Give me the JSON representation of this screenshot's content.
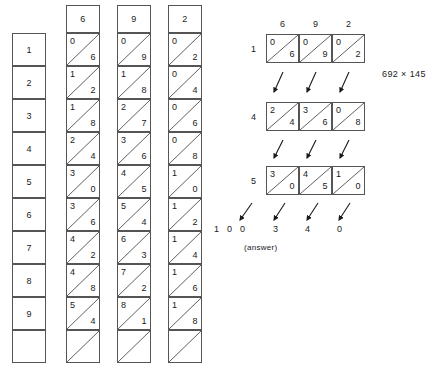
{
  "figure": {
    "expression": "692 × 145",
    "answer_caption": "(answer)",
    "answer_digits": "1  0  0      3      4      0"
  },
  "index_rod": {
    "label": "index",
    "values": [
      "1",
      "2",
      "3",
      "4",
      "5",
      "6",
      "7",
      "8",
      "9",
      ""
    ]
  },
  "rods": [
    {
      "name": "rod-6",
      "head": "6",
      "cells": [
        {
          "hi": "0",
          "lo": "6"
        },
        {
          "hi": "1",
          "lo": "2"
        },
        {
          "hi": "1",
          "lo": "8"
        },
        {
          "hi": "2",
          "lo": "4"
        },
        {
          "hi": "3",
          "lo": "0"
        },
        {
          "hi": "3",
          "lo": "6"
        },
        {
          "hi": "4",
          "lo": "2"
        },
        {
          "hi": "4",
          "lo": "8"
        },
        {
          "hi": "5",
          "lo": "4"
        },
        {
          "hi": "",
          "lo": ""
        }
      ]
    },
    {
      "name": "rod-9",
      "head": "9",
      "cells": [
        {
          "hi": "0",
          "lo": "9"
        },
        {
          "hi": "1",
          "lo": "8"
        },
        {
          "hi": "2",
          "lo": "7"
        },
        {
          "hi": "3",
          "lo": "6"
        },
        {
          "hi": "4",
          "lo": "5"
        },
        {
          "hi": "5",
          "lo": "4"
        },
        {
          "hi": "6",
          "lo": "3"
        },
        {
          "hi": "7",
          "lo": "2"
        },
        {
          "hi": "8",
          "lo": "1"
        },
        {
          "hi": "",
          "lo": ""
        }
      ]
    },
    {
      "name": "rod-2",
      "head": "2",
      "cells": [
        {
          "hi": "0",
          "lo": "2"
        },
        {
          "hi": "0",
          "lo": "4"
        },
        {
          "hi": "0",
          "lo": "6"
        },
        {
          "hi": "0",
          "lo": "8"
        },
        {
          "hi": "1",
          "lo": "0"
        },
        {
          "hi": "1",
          "lo": "2"
        },
        {
          "hi": "1",
          "lo": "4"
        },
        {
          "hi": "1",
          "lo": "6"
        },
        {
          "hi": "1",
          "lo": "8"
        },
        {
          "hi": "",
          "lo": ""
        }
      ]
    }
  ],
  "worked_example": {
    "column_headers": [
      "6",
      "9",
      "2"
    ],
    "rows": [
      {
        "multiplier": "1",
        "cells": [
          {
            "hi": "0",
            "lo": "6"
          },
          {
            "hi": "0",
            "lo": "9"
          },
          {
            "hi": "0",
            "lo": "2"
          }
        ]
      },
      {
        "multiplier": "4",
        "cells": [
          {
            "hi": "2",
            "lo": "4"
          },
          {
            "hi": "3",
            "lo": "6"
          },
          {
            "hi": "0",
            "lo": "8"
          }
        ]
      },
      {
        "multiplier": "5",
        "cells": [
          {
            "hi": "3",
            "lo": "0"
          },
          {
            "hi": "4",
            "lo": "5"
          },
          {
            "hi": "1",
            "lo": "0"
          }
        ]
      }
    ],
    "result_digits": [
      "1",
      "0",
      "0",
      "3",
      "4",
      "0"
    ]
  },
  "colors": {
    "ink": "#1a1a1a",
    "rule": "#555555",
    "background": "#ffffff"
  }
}
